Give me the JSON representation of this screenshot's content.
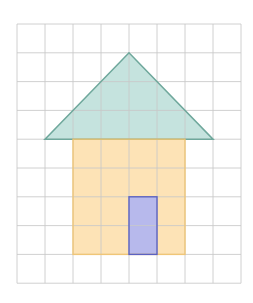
{
  "figure": {
    "grid": {
      "columns": 8,
      "rows": 9,
      "origin_px": [
        17,
        24
      ],
      "cell_w": 28,
      "cell_h": 28.8,
      "line_color": "#c8c8c8"
    },
    "shapes": {
      "roof": {
        "type": "triangle",
        "grid_points": [
          [
            1,
            4
          ],
          [
            4,
            1
          ],
          [
            7,
            4
          ]
        ],
        "fill": "#c5e3de",
        "stroke": "#6fa89c"
      },
      "body": {
        "type": "rectangle",
        "grid_x": 2,
        "grid_y": 4,
        "grid_w": 4,
        "grid_h": 4,
        "fill": "#fde3b6",
        "stroke": "#f3c46e"
      },
      "door": {
        "type": "rectangle",
        "grid_x": 4,
        "grid_y": 6,
        "grid_w": 1,
        "grid_h": 2,
        "fill": "#b7b9ec",
        "stroke": "#5b62c2"
      }
    }
  }
}
